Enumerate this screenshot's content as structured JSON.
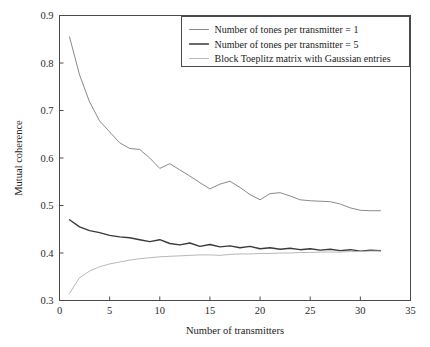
{
  "chart_data": {
    "type": "line",
    "title": "",
    "xlabel": "Number of transmitters",
    "ylabel": "Mutual coherence",
    "xlim": [
      0,
      35
    ],
    "ylim": [
      0.3,
      0.9
    ],
    "xticks": [
      0,
      5,
      10,
      15,
      20,
      25,
      30,
      35
    ],
    "yticks": [
      0.3,
      0.4,
      0.5,
      0.6,
      0.7,
      0.8,
      0.9
    ],
    "xtick_labels": [
      "0",
      "5",
      "10",
      "15",
      "20",
      "25",
      "30",
      "35"
    ],
    "ytick_labels": [
      "0.3",
      "0.4",
      "0.5",
      "0.6",
      "0.7",
      "0.8",
      "0.9"
    ],
    "grid": false,
    "legend_position": "upper right",
    "x": [
      1,
      2,
      3,
      4,
      5,
      6,
      7,
      8,
      9,
      10,
      11,
      12,
      13,
      14,
      15,
      16,
      17,
      18,
      19,
      20,
      21,
      22,
      23,
      24,
      25,
      26,
      27,
      28,
      29,
      30,
      31,
      32
    ],
    "series": [
      {
        "name": "Number of tones per transmitter = 1",
        "color": "#8a8a8a",
        "width": 1.0,
        "values": [
          0.855,
          0.775,
          0.718,
          0.678,
          0.655,
          0.632,
          0.62,
          0.618,
          0.6,
          0.578,
          0.588,
          0.575,
          0.562,
          0.548,
          0.535,
          0.545,
          0.551,
          0.538,
          0.523,
          0.512,
          0.525,
          0.527,
          0.52,
          0.512,
          0.51,
          0.509,
          0.508,
          0.503,
          0.495,
          0.49,
          0.489,
          0.489
        ]
      },
      {
        "name": "Number of tones per transmitter = 5",
        "color": "#3a3a3a",
        "width": 1.4,
        "values": [
          0.47,
          0.455,
          0.447,
          0.443,
          0.437,
          0.434,
          0.432,
          0.428,
          0.424,
          0.428,
          0.42,
          0.417,
          0.421,
          0.414,
          0.418,
          0.413,
          0.415,
          0.411,
          0.414,
          0.409,
          0.411,
          0.408,
          0.41,
          0.407,
          0.409,
          0.406,
          0.408,
          0.405,
          0.407,
          0.404,
          0.406,
          0.405
        ]
      },
      {
        "name": "Block Toeplitz matrix with Gaussian entries",
        "color": "#b8b8b8",
        "width": 1.0,
        "values": [
          0.315,
          0.348,
          0.362,
          0.371,
          0.377,
          0.381,
          0.385,
          0.388,
          0.39,
          0.392,
          0.393,
          0.394,
          0.395,
          0.396,
          0.396,
          0.395,
          0.397,
          0.398,
          0.398,
          0.399,
          0.399,
          0.4,
          0.4,
          0.401,
          0.401,
          0.402,
          0.402,
          0.402,
          0.403,
          0.403,
          0.404,
          0.404
        ]
      }
    ]
  },
  "legend": {
    "items": [
      {
        "label": "Number of tones per transmitter = 1"
      },
      {
        "label": "Number of tones per transmitter = 5"
      },
      {
        "label": "Block Toeplitz matrix with Gaussian entries"
      }
    ]
  }
}
